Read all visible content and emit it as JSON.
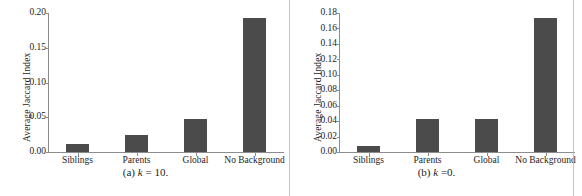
{
  "figure": {
    "panels": [
      {
        "caption_prefix": "(a)",
        "caption_var": "k",
        "caption_eq": "= 10.",
        "ylabel": "Average Jaccard Index",
        "yticks": [
          "0.00",
          "0.05",
          "0.10",
          "0.15",
          "0.20"
        ],
        "categories": [
          "Siblings",
          "Parents",
          "Global",
          "No Background"
        ],
        "values": [
          0.011,
          0.025,
          0.048,
          0.193
        ]
      },
      {
        "caption_prefix": "(b)",
        "caption_var": "k",
        "caption_eq": "=0.",
        "ylabel": "Average Jaccard Index",
        "yticks": [
          "0.00",
          "0.02",
          "0.04",
          "0.06",
          "0.08",
          "0.10",
          "0.12",
          "0.14",
          "0.16",
          "0.18"
        ],
        "categories": [
          "Siblings",
          "Parents",
          "Global",
          "No Background"
        ],
        "values": [
          0.008,
          0.0425,
          0.043,
          0.174
        ]
      }
    ]
  },
  "colors": {
    "bar": "#4b4b4b",
    "axis": "#8d8d8d",
    "text": "#1d1d1d",
    "separator": "#b9b9b9"
  },
  "chart_data": [
    {
      "type": "bar",
      "title": "(a) k = 10.",
      "xlabel": "",
      "ylabel": "Average Jaccard Index",
      "categories": [
        "Siblings",
        "Parents",
        "Global",
        "No Background"
      ],
      "values": [
        0.011,
        0.025,
        0.048,
        0.193
      ],
      "ylim": [
        0.0,
        0.2
      ],
      "ytick_values": [
        0.0,
        0.05,
        0.1,
        0.15,
        0.2
      ],
      "ytick_labels": [
        "0.00",
        "0.05",
        "0.10",
        "0.15",
        "0.20"
      ],
      "grid": false,
      "legend": "none",
      "bar_color": "#4b4b4b"
    },
    {
      "type": "bar",
      "title": "(b) k =0.",
      "xlabel": "",
      "ylabel": "Average Jaccard Index",
      "categories": [
        "Siblings",
        "Parents",
        "Global",
        "No Background"
      ],
      "values": [
        0.008,
        0.0425,
        0.043,
        0.174
      ],
      "ylim": [
        0.0,
        0.18
      ],
      "ytick_values": [
        0.0,
        0.02,
        0.04,
        0.06,
        0.08,
        0.1,
        0.12,
        0.14,
        0.16,
        0.18
      ],
      "ytick_labels": [
        "0.00",
        "0.02",
        "0.04",
        "0.06",
        "0.08",
        "0.10",
        "0.12",
        "0.14",
        "0.16",
        "0.18"
      ],
      "grid": false,
      "legend": "none",
      "bar_color": "#4b4b4b"
    }
  ]
}
